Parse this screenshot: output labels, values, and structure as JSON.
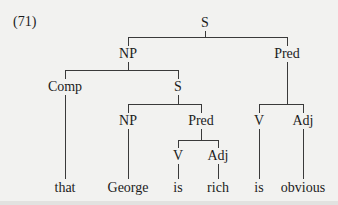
{
  "example_number": "(71)",
  "tree": {
    "root": "S",
    "nodes": {
      "s_root": "S",
      "np_subject": "NP",
      "pred_main": "Pred",
      "comp": "Comp",
      "s_embedded": "S",
      "np_embedded": "NP",
      "pred_embedded": "Pred",
      "v_main": "V",
      "adj_main": "Adj",
      "v_embedded": "V",
      "adj_embedded": "Adj"
    },
    "leaves": {
      "that": "that",
      "george": "George",
      "is_embedded": "is",
      "rich": "rich",
      "is_main": "is",
      "obvious": "obvious"
    },
    "structure": "[S [NP [Comp that] [S [NP George] [Pred [V is] [Adj rich]]]] [Pred [V is] [Adj obvious]]]"
  }
}
